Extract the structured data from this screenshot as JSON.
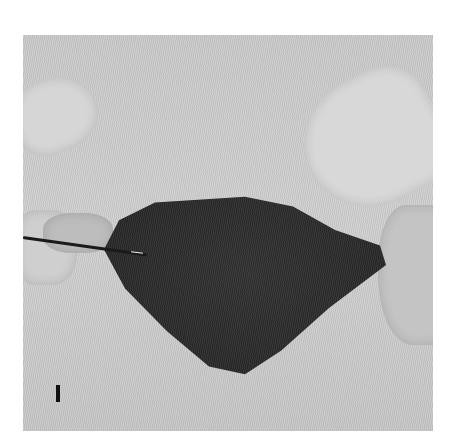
{
  "image": {
    "description": "Grayscale clinical photograph of a dark, irregular tissue mass held by gloved fingers on a light textured background, with a thin probe inserted from the left",
    "panel_label": "I",
    "colors": {
      "background": "#ffffff",
      "photo_field": "#cbcbcb",
      "tissue": "#2a2a2a",
      "probe": "#1a1a1a"
    }
  }
}
